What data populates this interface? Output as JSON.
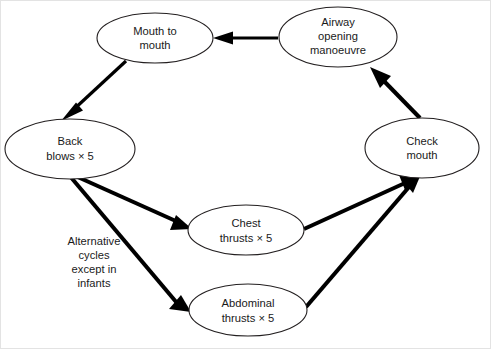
{
  "diagram": {
    "background_color": "#ffffff",
    "stroke_color": "#231f20",
    "arrow_color": "#000000",
    "text_color": "#1a1a1a",
    "nodes": [
      {
        "id": "mouth-to-mouth",
        "lines": [
          "Mouth to",
          "mouth"
        ],
        "line1": "Mouth to",
        "line2": "mouth",
        "cx": 154,
        "cy": 37,
        "rx": 58,
        "ry": 25
      },
      {
        "id": "airway-opening-manoeuvre",
        "lines": [
          "Airway",
          "opening",
          "manoeuvre"
        ],
        "line1": "Airway",
        "line2": "opening",
        "line3": "manoeuvre",
        "cx": 337,
        "cy": 36,
        "rx": 59,
        "ry": 30
      },
      {
        "id": "back-blows",
        "lines": [
          "Back",
          "blows × 5"
        ],
        "line1": "Back",
        "line2": "blows × 5",
        "cx": 69,
        "cy": 148,
        "rx": 65,
        "ry": 30
      },
      {
        "id": "check-mouth",
        "lines": [
          "Check",
          "mouth"
        ],
        "line1": "Check",
        "line2": "mouth",
        "cx": 421,
        "cy": 147,
        "rx": 57,
        "ry": 30
      },
      {
        "id": "chest-thrusts",
        "lines": [
          "Chest",
          "thrusts × 5"
        ],
        "line1": "Chest",
        "line2": "thrusts × 5",
        "cx": 245,
        "cy": 229,
        "rx": 58,
        "ry": 25
      },
      {
        "id": "abdominal-thrusts",
        "lines": [
          "Abdominal",
          "thrusts × 5"
        ],
        "line1": "Abdominal",
        "line2": "thrusts × 5",
        "cx": 247,
        "cy": 309,
        "rx": 59,
        "ry": 26
      }
    ],
    "annotation": {
      "id": "alternative-cycles-note",
      "lines": [
        "Alternative",
        "cycles",
        "except in",
        "infants"
      ],
      "line1": "Alternative",
      "line2": "cycles",
      "line3": "except in",
      "line4": "infants",
      "x": 93,
      "y": 244
    },
    "edges": [
      {
        "id": "airway-to-mouth",
        "from": "airway-opening-manoeuvre",
        "to": "mouth-to-mouth",
        "direction": "left"
      },
      {
        "id": "mouth-to-back-blows",
        "from": "mouth-to-mouth",
        "to": "back-blows",
        "direction": "down-left"
      },
      {
        "id": "back-blows-to-chest",
        "from": "back-blows",
        "to": "chest-thrusts",
        "direction": "down-right"
      },
      {
        "id": "back-blows-to-abdominal",
        "from": "back-blows",
        "to": "abdominal-thrusts",
        "direction": "down-right"
      },
      {
        "id": "chest-to-check-mouth",
        "from": "chest-thrusts",
        "to": "check-mouth",
        "direction": "up-right"
      },
      {
        "id": "abdominal-to-check-mouth",
        "from": "abdominal-thrusts",
        "to": "check-mouth",
        "direction": "up-right"
      },
      {
        "id": "check-mouth-to-airway",
        "from": "check-mouth",
        "to": "airway-opening-manoeuvre",
        "direction": "up-left"
      }
    ]
  }
}
